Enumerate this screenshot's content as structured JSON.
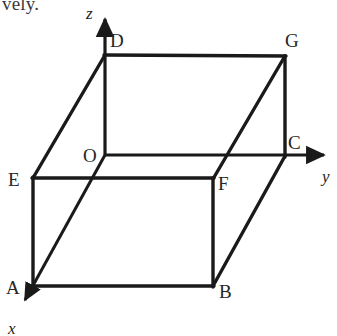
{
  "figure": {
    "kind": "3d-coordinate-box-diagram",
    "background_color": "#ffffff",
    "stroke_color": "#1a1a1a",
    "cut_off_caption": "vely.",
    "axes": [
      {
        "name": "x-axis",
        "label": "x",
        "label_x": 8,
        "label_y": 322,
        "from": [
          105,
          155
        ],
        "to": [
          19,
          311
        ]
      },
      {
        "name": "y-axis",
        "label": "y",
        "label_x": 322,
        "label_y": 170,
        "from": [
          105,
          155
        ],
        "to": [
          331,
          155
        ]
      },
      {
        "name": "z-axis",
        "label": "z",
        "label_x": 86,
        "label_y": 4,
        "from": [
          105,
          155
        ],
        "to": [
          105,
          13
        ]
      }
    ],
    "vertices": [
      {
        "id": "O",
        "label": "O",
        "x": 105,
        "y": 155,
        "label_x": 83,
        "label_y": 146
      },
      {
        "id": "A",
        "label": "A",
        "x": 33,
        "y": 286,
        "label_x": 6,
        "label_y": 278
      },
      {
        "id": "B",
        "label": "B",
        "x": 213,
        "y": 286,
        "label_x": 219,
        "label_y": 282
      },
      {
        "id": "C",
        "label": "C",
        "x": 285,
        "y": 155,
        "label_x": 288,
        "label_y": 133
      },
      {
        "id": "D",
        "label": "D",
        "x": 105,
        "y": 55,
        "label_x": 110,
        "label_y": 31
      },
      {
        "id": "E",
        "label": "E",
        "x": 33,
        "y": 178,
        "label_x": 8,
        "label_y": 170
      },
      {
        "id": "F",
        "label": "F",
        "x": 213,
        "y": 178,
        "label_x": 218,
        "label_y": 174
      },
      {
        "id": "G",
        "label": "G",
        "x": 285,
        "y": 56,
        "label_x": 285,
        "label_y": 31
      }
    ],
    "edges": [
      {
        "name": "edge-D-G",
        "from": "D",
        "to": "G",
        "weight": "thick"
      },
      {
        "name": "edge-D-O",
        "from": "D",
        "to": "O",
        "weight": "thin"
      },
      {
        "name": "edge-D-E",
        "from": "D",
        "to": "E",
        "weight": "thick"
      },
      {
        "name": "edge-G-C",
        "from": "G",
        "to": "C",
        "weight": "thick"
      },
      {
        "name": "edge-G-F",
        "from": "G",
        "to": "F",
        "weight": "thick"
      },
      {
        "name": "edge-O-C",
        "from": "O",
        "to": "C",
        "weight": "thin"
      },
      {
        "name": "edge-E-F",
        "from": "E",
        "to": "F",
        "weight": "thick"
      },
      {
        "name": "edge-E-A",
        "from": "E",
        "to": "A",
        "weight": "thick"
      },
      {
        "name": "edge-F-B",
        "from": "F",
        "to": "B",
        "weight": "thick"
      },
      {
        "name": "edge-C-B",
        "from": "C",
        "to": "B",
        "weight": "thick"
      },
      {
        "name": "edge-A-B",
        "from": "A",
        "to": "B",
        "weight": "thick"
      },
      {
        "name": "edge-O-A",
        "from": "O",
        "to": "A",
        "weight": "thin"
      }
    ]
  }
}
